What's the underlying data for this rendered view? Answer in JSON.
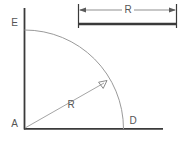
{
  "figure": {
    "type": "geometry-diagram",
    "background_color": "#ffffff"
  },
  "labels": {
    "vertex_a": "A",
    "vertex_e": "E",
    "vertex_d": "D",
    "radius_inner": "R",
    "radius_dimension": "R"
  },
  "colors": {
    "axis_line": "#3a3a3a",
    "arc_line": "#9a9a9a",
    "radius_line": "#9a9a9a",
    "dimension_line": "#8f8f8f",
    "dimension_bar": "#3a3a3a",
    "text": "#555555"
  },
  "geometry": {
    "center_x": 24,
    "center_y": 129,
    "radius": 99,
    "vertical_axis_top_y": 8,
    "horizontal_axis_right_x": 163,
    "arc_start_x": 24,
    "arc_start_y": 30,
    "arc_end_x": 123,
    "arc_end_y": 129,
    "radius_arrow_x": 106,
    "radius_arrow_y": 82
  },
  "dimension_bar": {
    "left_x": 78,
    "right_x": 177,
    "arrow_line_y": 10,
    "bar_y": 24,
    "tick_top_y": 4,
    "tick_bottom_y": 28,
    "label_x": 128
  }
}
